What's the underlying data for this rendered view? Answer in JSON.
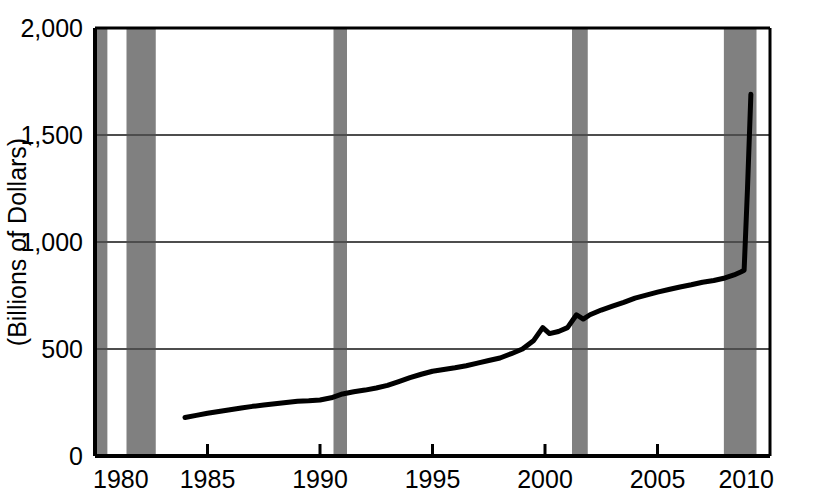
{
  "chart_data": {
    "type": "line",
    "title": "",
    "subtitle": "",
    "xlabel": "",
    "ylabel": "(Billions of Dollars)",
    "xlim": [
      1980,
      2010
    ],
    "ylim": [
      0,
      2000
    ],
    "grid": true,
    "legend_position": "none",
    "xticks": [
      "1980",
      "1985",
      "1990",
      "1995",
      "2000",
      "2005",
      "2010"
    ],
    "xtick_values": [
      1980,
      1985,
      1990,
      1995,
      2000,
      2005,
      2010
    ],
    "yticks": [
      "0",
      "500",
      "1,000",
      "1,500",
      "2,000"
    ],
    "ytick_values": [
      0,
      500,
      1000,
      1500,
      2000
    ],
    "series": [
      {
        "name": "Monetary Base",
        "color": "#000000",
        "x": [
          1984.0,
          1984.5,
          1985.0,
          1985.5,
          1986.0,
          1986.5,
          1987.0,
          1987.5,
          1988.0,
          1988.5,
          1989.0,
          1989.5,
          1990.0,
          1990.5,
          1991.0,
          1991.5,
          1992.0,
          1992.5,
          1993.0,
          1993.5,
          1994.0,
          1994.5,
          1995.0,
          1995.5,
          1996.0,
          1996.5,
          1997.0,
          1997.5,
          1998.0,
          1998.5,
          1999.0,
          1999.5,
          1999.9,
          2000.2,
          2000.6,
          2001.0,
          2001.4,
          2001.7,
          2002.0,
          2002.5,
          2003.0,
          2003.5,
          2004.0,
          2004.5,
          2005.0,
          2005.5,
          2006.0,
          2006.5,
          2007.0,
          2007.5,
          2008.0,
          2008.4,
          2008.7,
          2008.85,
          2009.0,
          2009.15
        ],
        "y": [
          180,
          190,
          200,
          208,
          216,
          224,
          232,
          238,
          244,
          250,
          256,
          258,
          262,
          272,
          290,
          300,
          308,
          318,
          330,
          348,
          366,
          382,
          396,
          404,
          412,
          422,
          434,
          446,
          458,
          478,
          500,
          540,
          600,
          572,
          582,
          600,
          660,
          640,
          660,
          682,
          700,
          718,
          738,
          752,
          766,
          778,
          790,
          800,
          812,
          820,
          832,
          846,
          860,
          868,
          1250,
          1690
        ]
      }
    ],
    "recession_bands": [
      {
        "start": 1980.05,
        "end": 1980.55
      },
      {
        "start": 1981.4,
        "end": 2982.7,
        "start_year": 1981.4,
        "end_year": 1982.7
      },
      {
        "start": 1990.6,
        "end": 1991.2
      },
      {
        "start": 2001.2,
        "end": 2001.9
      },
      {
        "start": 2007.95,
        "end": 2009.4
      }
    ],
    "recession_color": "#808080",
    "line_color": "#000000",
    "background_color": "#ffffff",
    "axis_color": "#000000",
    "gridline_color": "#4d4d4d"
  }
}
